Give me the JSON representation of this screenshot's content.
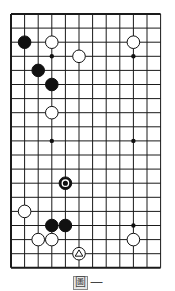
{
  "diagram": {
    "type": "go-board-partial",
    "grid": {
      "columns": 12,
      "rows": 19,
      "origin_x": 11,
      "origin_y": 14,
      "dx": 13.6,
      "dy": 14.1,
      "edges": [
        "left",
        "top",
        "bottom"
      ],
      "line_color": "#1a1a1a"
    },
    "star_points": [
      [
        3,
        3
      ],
      [
        9,
        3
      ],
      [
        3,
        9
      ],
      [
        9,
        9
      ],
      [
        9,
        15
      ]
    ],
    "stones": [
      {
        "color": "black",
        "col": 1,
        "row": 2
      },
      {
        "color": "white",
        "col": 3,
        "row": 2
      },
      {
        "color": "white",
        "col": 9,
        "row": 2
      },
      {
        "color": "white",
        "col": 5,
        "row": 3
      },
      {
        "color": "black",
        "col": 2,
        "row": 4
      },
      {
        "color": "black",
        "col": 3,
        "row": 5
      },
      {
        "color": "white",
        "col": 3,
        "row": 7
      },
      {
        "color": "black",
        "col": 4,
        "row": 12,
        "mark": "circle"
      },
      {
        "color": "white",
        "col": 1,
        "row": 14
      },
      {
        "color": "black",
        "col": 3,
        "row": 15
      },
      {
        "color": "black",
        "col": 4,
        "row": 15
      },
      {
        "color": "white",
        "col": 2,
        "row": 16
      },
      {
        "color": "white",
        "col": 3,
        "row": 16
      },
      {
        "color": "white",
        "col": 9,
        "row": 16
      },
      {
        "color": "white",
        "col": 5,
        "row": 17,
        "mark": "triangle"
      }
    ]
  },
  "caption": {
    "figure_label": "圖",
    "number": "一"
  }
}
